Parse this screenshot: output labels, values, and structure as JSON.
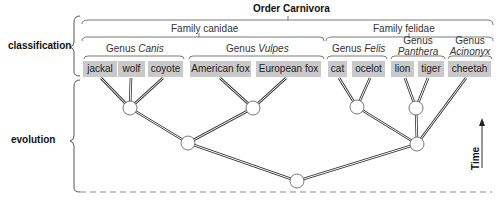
{
  "order": {
    "label": "Order Carnivora"
  },
  "side_labels": {
    "classification": "classification",
    "evolution": "evolution"
  },
  "families": [
    {
      "label": "Family canidae"
    },
    {
      "label": "Family felidae"
    }
  ],
  "genera": [
    {
      "prefix": "Genus",
      "name": "Canis"
    },
    {
      "prefix": "Genus",
      "name": "Vulpes"
    },
    {
      "prefix": "Genus",
      "name": "Felis"
    },
    {
      "prefix": "Genus",
      "name": "Panthera"
    },
    {
      "prefix": "Genus",
      "name": "Acinonyx"
    }
  ],
  "species": [
    {
      "label": "jackal"
    },
    {
      "label": "wolf"
    },
    {
      "label": "coyote"
    },
    {
      "label": "American fox"
    },
    {
      "label": "European fox"
    },
    {
      "label": "cat"
    },
    {
      "label": "ocelot"
    },
    {
      "label": "lion"
    },
    {
      "label": "tiger"
    },
    {
      "label": "cheetah"
    }
  ],
  "time_axis": {
    "label": "Time"
  },
  "colors": {
    "species_box": "#c9c9c9",
    "line": "#333333",
    "node_fill": "#ffffff"
  }
}
